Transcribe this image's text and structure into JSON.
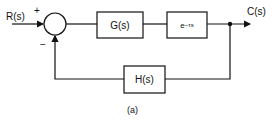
{
  "diagram": {
    "type": "feedback-control-block-diagram",
    "input_label": "R(s)",
    "output_label": "C(s)",
    "summing_junction": {
      "plus_sign": "+",
      "minus_sign": "−"
    },
    "blocks": {
      "forward_1": "G(s)",
      "forward_2_base": "e",
      "forward_2_exponent": "−τs",
      "feedback": "H(s)"
    },
    "caption": "(a)"
  }
}
